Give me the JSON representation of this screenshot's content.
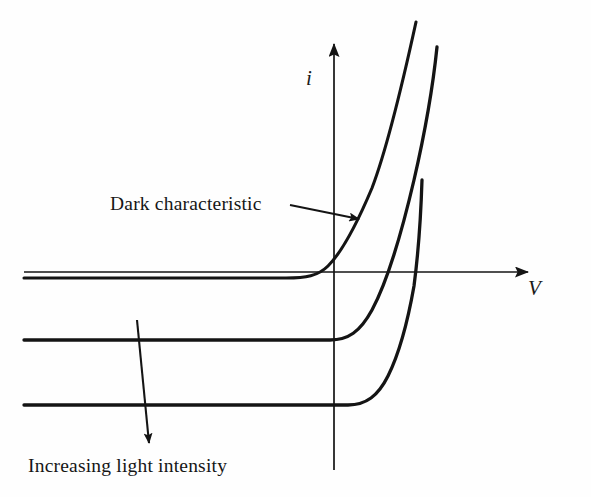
{
  "figure": {
    "kind": "diagram",
    "background_color": "#fefefe",
    "ink_color": "#141414"
  },
  "axes": {
    "vertical": {
      "label": "i",
      "name": "current-axis",
      "direction": "up",
      "arrowhead": true,
      "origin_x": 334,
      "top_y": 38,
      "bottom_y": 470
    },
    "horizontal": {
      "label": "V",
      "name": "voltage-axis",
      "direction": "right",
      "arrowhead": true,
      "origin_y": 272,
      "left_x": 24,
      "right_x": 533
    }
  },
  "annotations": [
    {
      "id": "dark-characteristic",
      "text": "Dark characteristic",
      "text_x": 110,
      "text_y": 193,
      "arrow": {
        "from_x": 290,
        "from_y": 205,
        "to_x": 359,
        "to_y": 219,
        "arrowhead": "end"
      }
    },
    {
      "id": "increasing-light-intensity",
      "text": "Increasing light intensity",
      "text_x": 28,
      "text_y": 455,
      "arrow": {
        "from_x": 137,
        "from_y": 320,
        "to_x": 149,
        "to_y": 443,
        "arrowhead": "end"
      }
    }
  ],
  "chart_data": {
    "type": "line",
    "title": "",
    "xlabel": "V",
    "ylabel": "i",
    "grid": false,
    "legend": "inline annotations",
    "series": [
      {
        "name": "Dark characteristic",
        "illumination": "none",
        "saturation_level_px_y": 278,
        "knee_px_x": 320,
        "crosses_origin": true,
        "top_end": {
          "x": 416,
          "y": 22
        },
        "path": "M 24,278 L 286,278 C 306,278 318,276 328,266 C 342,252 356,226 372,188 C 388,146 402,86 416,22"
      },
      {
        "name": "Illuminated curve 1",
        "illumination": "medium",
        "saturation_level_px_y": 340,
        "knee_px_x": 334,
        "crosses_origin": false,
        "top_end": {
          "x": 437,
          "y": 47
        },
        "path": "M 24,340 L 330,340 C 348,340 360,332 372,310 C 386,284 400,240 414,180 C 426,128 433,86 437,47"
      },
      {
        "name": "Illuminated curve 2",
        "illumination": "high",
        "saturation_level_px_y": 405,
        "knee_px_x": 352,
        "crosses_origin": false,
        "top_end": {
          "x": 422,
          "y": 180
        },
        "path": "M 24,405 L 348,405 C 366,405 378,396 388,376 C 399,354 408,320 414,286 C 419,248 421,212 422,180"
      }
    ],
    "x_axis_ticks": [],
    "y_axis_ticks": []
  }
}
